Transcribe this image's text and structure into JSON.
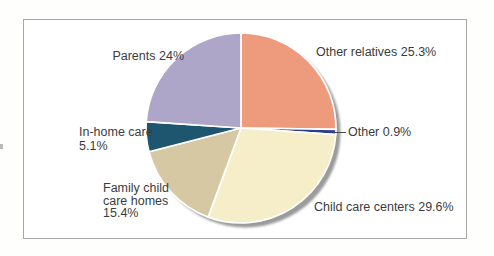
{
  "figure": {
    "background_color": "#ffffff",
    "border_color": "#a8a8a8",
    "text_color": "#3c3c3c"
  },
  "chart_data": {
    "type": "pie",
    "title": "",
    "direction": "clockwise",
    "start_angle_deg": 0,
    "stroke_color": "#ffffff",
    "shadow_color": "#9b9b9b",
    "slices": [
      {
        "label": "Other relatives",
        "value": 25.3,
        "display": "Other relatives 25.3%",
        "color": "#ee9b7d"
      },
      {
        "label": "Other",
        "value": 0.9,
        "display": "Other 0.9%",
        "color": "#2e3b8f"
      },
      {
        "label": "Child care centers",
        "value": 29.6,
        "display": "Child care centers 29.6%",
        "color": "#f6eec8"
      },
      {
        "label": "Family child care homes",
        "value": 15.4,
        "display": "Family child care homes 15.4%",
        "color": "#d7c8a4"
      },
      {
        "label": "In-home care",
        "value": 5.1,
        "display": "In-home care 5.1%",
        "color": "#1d566e"
      },
      {
        "label": "Parents",
        "value": 24.0,
        "display": "Parents 24%",
        "color": "#ada6c9"
      }
    ],
    "geometry": {
      "cx": 241,
      "cy": 128,
      "r": 95
    }
  },
  "labels": {
    "parents": "Parents 24%",
    "other_relatives": "Other relatives 25.3%",
    "other": "Other 0.9%",
    "child_care_centers": "Child care centers 29.6%",
    "family_line1": "Family child",
    "family_line2": "care homes",
    "family_line3": "15.4%",
    "inhome_line1": "In-home care",
    "inhome_line2": "5.1%"
  }
}
